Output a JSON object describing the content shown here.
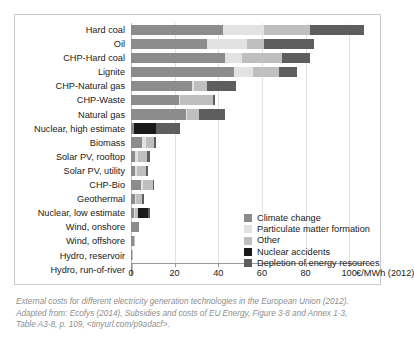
{
  "chart_data": {
    "type": "bar",
    "orientation": "horizontal",
    "stacked": true,
    "title": "",
    "xlabel": "€/MWh (2012)",
    "ylabel": "",
    "xlim": [
      0,
      110
    ],
    "xticks": [
      0,
      20,
      40,
      60,
      80,
      100
    ],
    "xtick_labels": [
      "0",
      "20",
      "40",
      "60",
      "80",
      "100"
    ],
    "unit_label": "€/MWh (2012)",
    "grid": true,
    "legend_position": "inside-bottom-right",
    "categories": [
      "Hard coal",
      "Oil",
      "CHP-Hard coal",
      "Lignite",
      "CHP-Natural gas",
      "CHP-Waste",
      "Natural gas",
      "Nuclear, high estimate",
      "Biomass",
      "Solar PV, rooftop",
      "Solar PV, utility",
      "CHP-Bio",
      "Geothermal",
      "Nuclear, low estimate",
      "Wind, onshore",
      "Wind, offshore",
      "Hydro, reservoir",
      "Hydro, run-of-river"
    ],
    "series": [
      {
        "name": "Climate change",
        "color": "#8c8c8c",
        "values": [
          42.0,
          35.0,
          43.0,
          47.0,
          28.0,
          22.0,
          25.0,
          1.5,
          5.0,
          2.0,
          2.0,
          4.5,
          2.0,
          1.5,
          3.5,
          1.5,
          0.6,
          0.6
        ]
      },
      {
        "name": "Particulate matter formation",
        "color": "#e2e2e2",
        "values": [
          19.0,
          18.0,
          8.0,
          9.0,
          1.0,
          0.5,
          0.5,
          0.0,
          2.0,
          1.0,
          0.8,
          1.0,
          0.5,
          0.5,
          0.0,
          0.0,
          0.0,
          0.0
        ]
      },
      {
        "name": "Other",
        "color": "#bfbfbf",
        "values": [
          21.0,
          8.0,
          18.0,
          12.0,
          6.0,
          15.0,
          5.5,
          0.0,
          3.5,
          4.5,
          4.0,
          4.5,
          2.5,
          1.0,
          0.0,
          0.4,
          0.2,
          0.2
        ]
      },
      {
        "name": "Nuclear accidents",
        "color": "#1a1a1a",
        "values": [
          0.0,
          0.0,
          0.0,
          0.0,
          0.0,
          0.0,
          0.0,
          10.0,
          0.0,
          0.0,
          0.0,
          0.0,
          0.0,
          5.0,
          0.0,
          0.0,
          0.0,
          0.0
        ]
      },
      {
        "name": "Depletion of energy resources",
        "color": "#5e5e5e",
        "values": [
          25.0,
          23.0,
          13.0,
          8.0,
          13.0,
          1.0,
          12.0,
          11.0,
          0.8,
          1.0,
          1.2,
          0.6,
          1.0,
          0.8,
          0.0,
          0.0,
          0.0,
          0.0
        ]
      }
    ],
    "totals": [
      107.0,
      84.0,
      82.0,
      76.0,
      48.0,
      38.5,
      43.0,
      22.5,
      11.3,
      8.5,
      8.0,
      10.6,
      6.0,
      8.8,
      3.5,
      1.9,
      0.8,
      0.8
    ]
  },
  "legend": {
    "items": [
      {
        "label": "Climate change",
        "color": "#8c8c8c"
      },
      {
        "label": "Particulate matter formation",
        "color": "#e2e2e2"
      },
      {
        "label": "Other",
        "color": "#bfbfbf"
      },
      {
        "label": "Nuclear accidents",
        "color": "#1a1a1a"
      },
      {
        "label": "Depletion of energy resources",
        "color": "#5e5e5e"
      }
    ]
  },
  "caption": {
    "line1": "External costs for different electricity generation technologies in the European Union (2012).",
    "line2": "Adapted from: Ecofys (2014), Subsidies and costs of EU Energy, Figure 3-8 and Annex 1-3,",
    "line3": "Table A3-8, p. 109, <tinyurl.com/p9adacf>."
  },
  "colors": {
    "panel_border": "#c9c9c9",
    "gridline": "#e2e2e2",
    "axis": "#9a9a9a",
    "text": "#1a1a1a",
    "caption_text": "#8e8e8e"
  }
}
